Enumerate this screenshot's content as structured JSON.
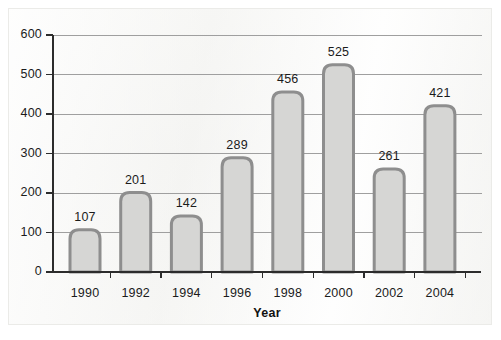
{
  "chart_data": {
    "type": "bar",
    "title": "",
    "subtitle": "",
    "xlabel": "Year",
    "ylabel": "",
    "categories": [
      "1990",
      "1992",
      "1994",
      "1996",
      "1998",
      "2000",
      "2002",
      "2004"
    ],
    "values": [
      107,
      201,
      142,
      289,
      456,
      525,
      261,
      421
    ],
    "series": [
      {
        "name": "",
        "values": [
          107,
          201,
          142,
          289,
          456,
          525,
          261,
          421
        ]
      }
    ],
    "data_labels": [
      "107",
      "201",
      "142",
      "289",
      "456",
      "525",
      "261",
      "421"
    ],
    "ylim": [
      0,
      600
    ],
    "xlim_categories": 8,
    "y_ticks": [
      0,
      100,
      200,
      300,
      400,
      500,
      600
    ],
    "y_tick_labels": [
      "0",
      "100",
      "200",
      "300",
      "400",
      "500",
      "600"
    ],
    "x_tick_labels": [
      "1990",
      "1992",
      "1994",
      "1996",
      "1998",
      "2000",
      "2002",
      "2004"
    ],
    "grid": "horizontal",
    "legend": "none",
    "legend_position": "",
    "annotations": []
  },
  "style": {
    "bar_fill": "#d6d6d4",
    "bar_stroke": "#8e8e8e",
    "grid_color": "#9f9f9f",
    "axis_color": "#2c2c2c",
    "text_color": "#1b1b1b",
    "panel_background": "#f5f5f3",
    "frame_border": "#ebebe8"
  }
}
